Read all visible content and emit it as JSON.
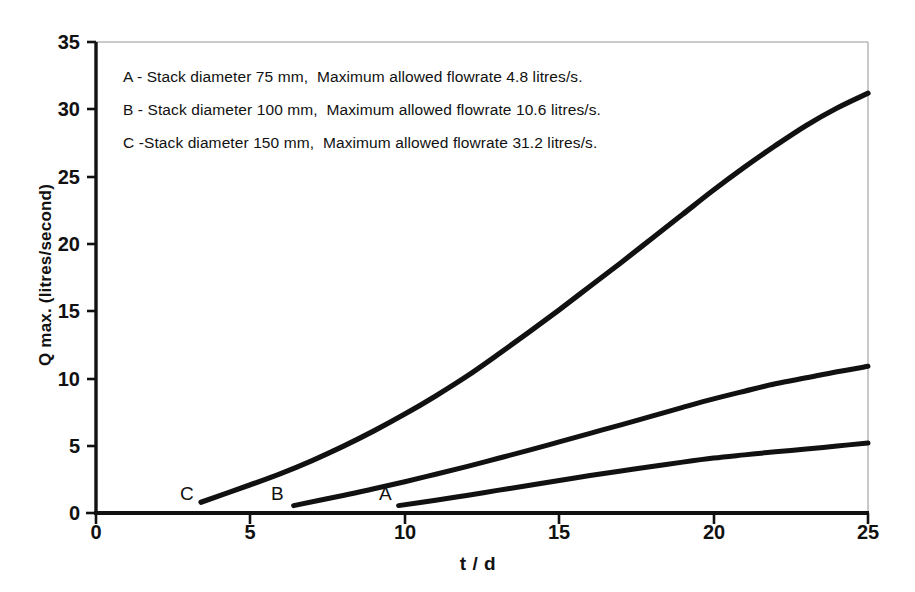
{
  "chart_data": {
    "type": "line",
    "title": "",
    "xlabel": "t / d",
    "ylabel": "Q max. (litres/second)",
    "xlim": [
      0,
      25
    ],
    "ylim": [
      0,
      35
    ],
    "xticks": [
      "0",
      "5",
      "10",
      "15",
      "20",
      "25"
    ],
    "yticks": [
      "0",
      "5",
      "10",
      "15",
      "20",
      "25",
      "30",
      "35"
    ],
    "grid": false,
    "legend_position": "inside-top-left",
    "annotations": [
      "A - Stack diameter 75 mm,  Maximum allowed flowrate 4.8 litres/s.",
      "B - Stack diameter 100 mm,  Maximum allowed flowrate 10.6 litres/s.",
      "C -Stack diameter 150 mm,  Maximum allowed flowrate 31.2 litres/s."
    ],
    "series": [
      {
        "name": "A",
        "label": "A",
        "stack_diameter_mm": 75,
        "max_allowed_flowrate_litres_per_s": 4.8,
        "points": [
          [
            9.8,
            0.55
          ],
          [
            11.0,
            0.95
          ],
          [
            12.0,
            1.3
          ],
          [
            13.0,
            1.68
          ],
          [
            14.0,
            2.05
          ],
          [
            15.0,
            2.42
          ],
          [
            16.0,
            2.78
          ],
          [
            17.0,
            3.12
          ],
          [
            18.0,
            3.45
          ],
          [
            19.0,
            3.78
          ],
          [
            20.0,
            4.08
          ],
          [
            21.0,
            4.32
          ],
          [
            22.0,
            4.55
          ],
          [
            23.0,
            4.75
          ],
          [
            24.0,
            4.98
          ],
          [
            25.0,
            5.2
          ]
        ]
      },
      {
        "name": "B",
        "label": "B",
        "stack_diameter_mm": 100,
        "max_allowed_flowrate_litres_per_s": 10.6,
        "points": [
          [
            6.4,
            0.55
          ],
          [
            8.0,
            1.3
          ],
          [
            9.0,
            1.8
          ],
          [
            10.0,
            2.32
          ],
          [
            11.0,
            2.88
          ],
          [
            12.0,
            3.45
          ],
          [
            13.0,
            4.05
          ],
          [
            14.0,
            4.65
          ],
          [
            15.0,
            5.28
          ],
          [
            16.0,
            5.92
          ],
          [
            17.0,
            6.55
          ],
          [
            18.0,
            7.2
          ],
          [
            19.0,
            7.85
          ],
          [
            20.0,
            8.48
          ],
          [
            21.0,
            9.05
          ],
          [
            22.0,
            9.6
          ],
          [
            23.0,
            10.05
          ],
          [
            24.0,
            10.5
          ],
          [
            25.0,
            10.9
          ]
        ]
      },
      {
        "name": "C",
        "label": "C",
        "stack_diameter_mm": 150,
        "max_allowed_flowrate_litres_per_s": 31.2,
        "points": [
          [
            3.4,
            0.8
          ],
          [
            5.0,
            2.1
          ],
          [
            6.0,
            2.95
          ],
          [
            7.0,
            3.9
          ],
          [
            8.0,
            4.95
          ],
          [
            9.0,
            6.1
          ],
          [
            10.0,
            7.35
          ],
          [
            11.0,
            8.7
          ],
          [
            12.0,
            10.15
          ],
          [
            13.0,
            11.75
          ],
          [
            14.0,
            13.4
          ],
          [
            15.0,
            15.1
          ],
          [
            16.0,
            16.85
          ],
          [
            17.0,
            18.6
          ],
          [
            18.0,
            20.4
          ],
          [
            19.0,
            22.2
          ],
          [
            20.0,
            24.0
          ],
          [
            21.0,
            25.7
          ],
          [
            22.0,
            27.3
          ],
          [
            23.0,
            28.8
          ],
          [
            24.0,
            30.1
          ],
          [
            25.0,
            31.2
          ]
        ]
      }
    ],
    "colors": {
      "curve": "#111111",
      "axis": "#111111",
      "frame": "#b4b4b4",
      "background": "#ffffff"
    }
  }
}
